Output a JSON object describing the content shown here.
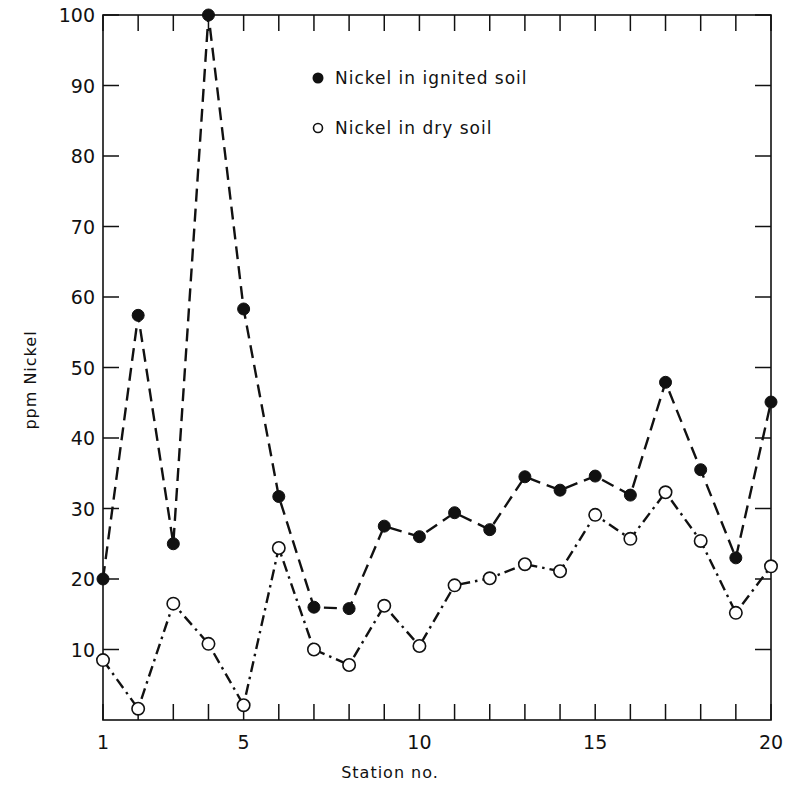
{
  "chart_data": {
    "type": "line",
    "title": "",
    "xlabel": "Station no.",
    "ylabel": "ppm Nickel",
    "x": [
      1,
      2,
      3,
      4,
      5,
      6,
      7,
      8,
      9,
      10,
      11,
      12,
      13,
      14,
      15,
      16,
      17,
      18,
      19,
      20
    ],
    "x_tick_labels": [
      "1",
      "5",
      "10",
      "15",
      "20"
    ],
    "x_tick_values": [
      1,
      5,
      10,
      15,
      20
    ],
    "y_tick_labels": [
      "10",
      "20",
      "30",
      "40",
      "50",
      "60",
      "70",
      "80",
      "90",
      "100"
    ],
    "y_tick_values": [
      10,
      20,
      30,
      40,
      50,
      60,
      70,
      80,
      90,
      100
    ],
    "xlim": [
      1,
      20
    ],
    "ylim": [
      0,
      100
    ],
    "grid": false,
    "legend_position": "upper center",
    "series": [
      {
        "name": "Nickel in ignited soil",
        "marker": "filled-circle",
        "line_style": "dashed",
        "values": [
          20,
          57.4,
          25,
          100,
          58.3,
          31.7,
          16,
          15.8,
          27.5,
          26,
          29.4,
          27,
          34.5,
          32.6,
          34.6,
          31.9,
          47.9,
          35.5,
          23,
          45.1
        ]
      },
      {
        "name": "Nickel in dry soil",
        "marker": "open-circle",
        "line_style": "dash-dot",
        "values": [
          8.5,
          1.6,
          16.5,
          10.8,
          2.1,
          24.4,
          10,
          7.8,
          16.2,
          10.5,
          19.1,
          20.1,
          22.1,
          21.1,
          29.1,
          25.7,
          32.3,
          25.4,
          15.2,
          21.8
        ]
      }
    ]
  },
  "legend": {
    "items": [
      {
        "label": "Nickel in ignited soil",
        "symbol": "●"
      },
      {
        "label": "Nickel in dry soil",
        "symbol": "○"
      }
    ]
  },
  "colors": {
    "ink": "#111111",
    "background": "#ffffff"
  }
}
